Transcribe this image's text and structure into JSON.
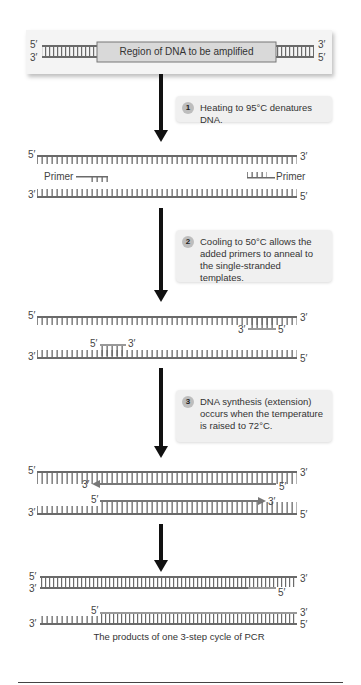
{
  "diagram": {
    "panel1": {
      "region_label": "Region of DNA to be amplified",
      "top_left": "5′",
      "top_right": "3′",
      "bottom_left": "3′",
      "bottom_right": "5′"
    },
    "step1": {
      "number": "1",
      "text": "Heating to 95°C denatures DNA."
    },
    "panel2": {
      "top_left": "5′",
      "top_right": "3′",
      "bottom_left": "3′",
      "bottom_right": "5′",
      "primer_left": "Primer",
      "primer_right": "Primer"
    },
    "step2": {
      "number": "2",
      "text": "Cooling to 50°C allows the added primers to anneal to the single-stranded templates."
    },
    "panel3": {
      "top_left": "5′",
      "top_right": "3′",
      "bottom_left": "3′",
      "bottom_right": "5′",
      "primer_top_left": "3′",
      "primer_top_right": "5′",
      "primer_bottom_left": "5′",
      "primer_bottom_right": "3′"
    },
    "step3": {
      "number": "3",
      "text": "DNA synthesis (extension) occurs when the temperature is raised to 72°C."
    },
    "panel4": {
      "top_left": "5′",
      "top_right": "3′",
      "bottom_left": "3′",
      "bottom_right": "5′",
      "new_top_left": "3′",
      "new_top_right": "5′",
      "new_bottom_left": "5′",
      "new_bottom_right": "3′"
    },
    "panel5": {
      "a_top_left": "5′",
      "a_top_right": "3′",
      "a_bottom_left": "3′",
      "a_bottom_right": "5′",
      "b_top_left": "5′",
      "b_top_right": "3′",
      "b_bottom_left": "3′",
      "b_bottom_right": "5′",
      "caption": "The products of one 3-step cycle of PCR"
    },
    "colors": {
      "strand": "#6a6a6a",
      "new_strand": "#999999",
      "arrow": "#111111",
      "panel_bg": "#f4f4f4",
      "step_badge": "#bdbdbd"
    }
  }
}
